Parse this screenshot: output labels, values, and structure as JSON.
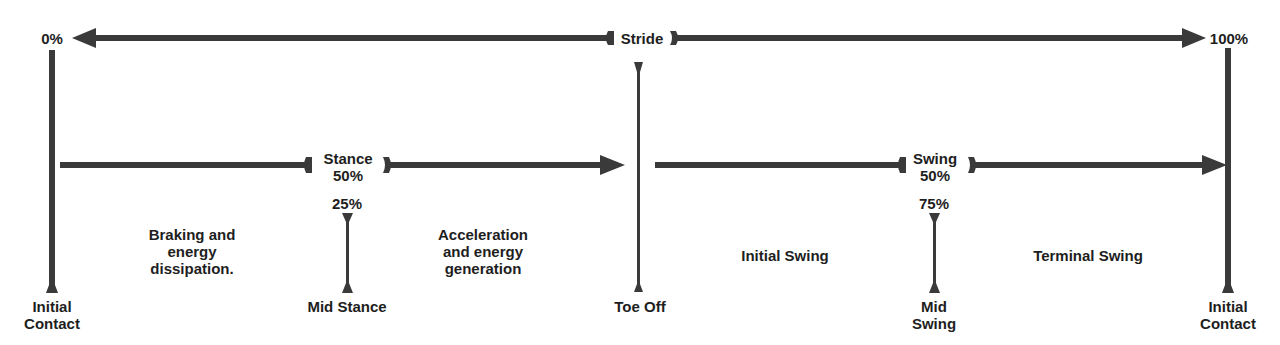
{
  "diagram": {
    "type": "gait-cycle-timeline",
    "colors": {
      "line": "#3a3a3a",
      "text": "#1e1e1e",
      "background": "#ffffff"
    },
    "stride": {
      "start_label": "0%",
      "center_label": "Stride",
      "end_label": "100%"
    },
    "stance": {
      "label": "Stance",
      "pct": "50%",
      "mid_pct": "25%",
      "mid_label": "Mid Stance",
      "left_desc": [
        "Braking and",
        "energy",
        "dissipation."
      ],
      "right_desc": [
        "Acceleration",
        "and energy",
        "generation"
      ]
    },
    "swing": {
      "label": "Swing",
      "pct": "50%",
      "mid_pct": "75%",
      "mid_label": [
        "Mid",
        "Swing"
      ],
      "left_desc": "Initial Swing",
      "right_desc": "Terminal Swing"
    },
    "events": {
      "start": [
        "Initial",
        "Contact"
      ],
      "toe_off": "Toe Off",
      "end": [
        "Initial",
        "Contact"
      ]
    }
  }
}
